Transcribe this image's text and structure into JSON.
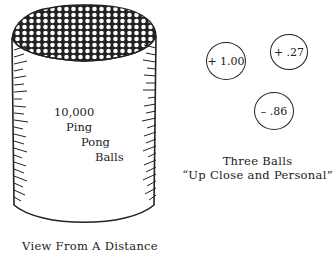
{
  "container": {
    "label_lines": [
      "10,000",
      "Ping",
      "Pong",
      "Balls"
    ],
    "caption": "View From A Distance"
  },
  "balls": [
    {
      "value": "+ 1.00"
    },
    {
      "value": "+ .27"
    },
    {
      "value": "– .86"
    }
  ],
  "closeup": {
    "caption_line1": "Three Balls",
    "caption_line2": "“Up Close and Personal”"
  },
  "colors": {
    "ink": "#222222",
    "background": "#ffffff"
  }
}
